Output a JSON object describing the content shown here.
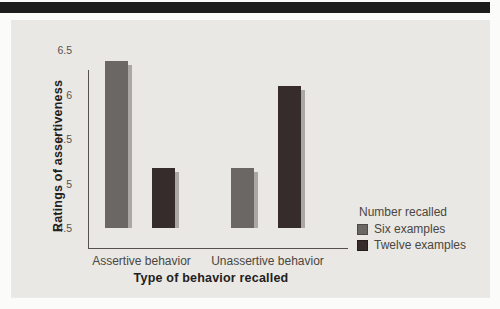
{
  "header": {
    "stripe_color": "#1c1c1c"
  },
  "figure": {
    "panel_bg": "#e9e8e4"
  },
  "chart_data": {
    "type": "bar",
    "title": "",
    "categories": [
      "Assertive behavior",
      "Unassertive behavior"
    ],
    "series": [
      {
        "name": "Six examples",
        "color": "#6b6765",
        "edge_color": "#4e4a48",
        "values": [
          6.38,
          5.17
        ]
      },
      {
        "name": "Twelve examples",
        "color": "#352c2b",
        "edge_color": "#241d1c",
        "values": [
          5.17,
          6.1
        ]
      }
    ],
    "xlabel": "Type of behavior recalled",
    "ylabel": "Ratings of assertiveness",
    "ylim": [
      4.5,
      6.5
    ],
    "yticks": [
      4.5,
      5,
      5.5,
      6,
      6.5
    ],
    "ytick_labels": [
      "4.5",
      "5",
      "5.5",
      "6",
      "6.5"
    ],
    "grid": false,
    "bar_shadow_color": "#a8a4a0",
    "legend": {
      "title": "Number recalled",
      "position": "right"
    }
  }
}
